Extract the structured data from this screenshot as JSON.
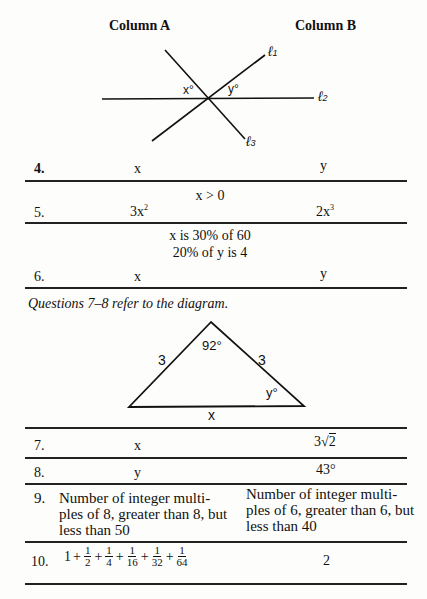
{
  "header": {
    "column_a": "Column A",
    "column_b": "Column B"
  },
  "diagram1": {
    "labels": {
      "l1": "ℓ",
      "l1_sub": "1",
      "l2": "ℓ",
      "l2_sub": "2",
      "l3": "ℓ",
      "l3_sub": "3",
      "x": "x°",
      "y": "y°"
    }
  },
  "questions": [
    {
      "num": "4.",
      "a": "x",
      "b": "y"
    },
    {
      "num": "5.",
      "condition": "x > 0",
      "a_base": "3x",
      "a_exp": "2",
      "b_base": "2x",
      "b_exp": "3"
    },
    {
      "num": "6.",
      "condition_lines": [
        "x is 30% of 60",
        "20% of y is 4"
      ],
      "a": "x",
      "b": "y"
    },
    {
      "num": "7.",
      "a": "x",
      "b_coef": "3",
      "b_radical": "√",
      "b_radicand": "2"
    },
    {
      "num": "8.",
      "a": "y",
      "b": "43°"
    },
    {
      "num": "9.",
      "a": "Number of integer multiples of 8, greater than 8, but less than 50",
      "b": "Number of integer multiples of 6, greater than 6, but less than 40",
      "a_lines": [
        "Number of integer multi-",
        "ples of 8, greater than 8, but",
        "less than 50"
      ],
      "b_lines": [
        "Number of integer multi-",
        "ples of 6, greater than 6, but",
        "less than 40"
      ]
    },
    {
      "num": "10.",
      "a_terms": {
        "lead": "1",
        "plus": "+",
        "fractions": [
          {
            "n": "1",
            "d": "2"
          },
          {
            "n": "1",
            "d": "4"
          },
          {
            "n": "1",
            "d": "16"
          },
          {
            "n": "1",
            "d": "32"
          },
          {
            "n": "1",
            "d": "64"
          }
        ]
      },
      "b": "2"
    }
  ],
  "instruction": "Questions 7–8 refer to the diagram.",
  "diagram2": {
    "labels": {
      "left_side": "3",
      "right_side": "3",
      "apex_angle": "92°",
      "base_angle": "y°",
      "base": "x"
    }
  }
}
